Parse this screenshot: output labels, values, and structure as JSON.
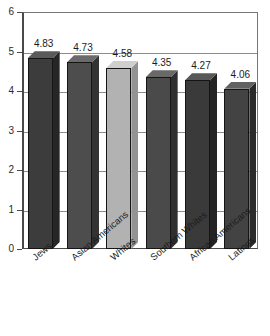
{
  "chart_data": {
    "type": "bar",
    "title": "",
    "subtitle": "",
    "xlabel": "",
    "ylabel": "",
    "categories": [
      "Jews",
      "Asian Americans",
      "Whites",
      "Southern Whites",
      "African Americans",
      "Latinos"
    ],
    "values": [
      4.83,
      4.73,
      4.58,
      4.35,
      4.27,
      4.06
    ],
    "value_labels": [
      "4.83",
      "4.73",
      "4.58",
      "4.35",
      "4.27",
      "4.06"
    ],
    "ylim": [
      0,
      6
    ],
    "yticks": [
      0,
      1,
      2,
      3,
      4,
      5,
      6
    ],
    "ytick_labels": [
      "0",
      "1",
      "2",
      "3",
      "4",
      "5",
      "6"
    ],
    "grid": true,
    "grid_axis": "y",
    "legend": false,
    "legend_position": "none",
    "style": "3d-column",
    "bar_colors": [
      "#3c3c3c",
      "#4d4d4d",
      "#b2b2b2",
      "#4a4a4a",
      "#3a3a3a",
      "#434343"
    ],
    "bar_top_colors": [
      "#5a5a5a",
      "#6b6b6b",
      "#cfcfcf",
      "#696969",
      "#585858",
      "#616161"
    ],
    "bar_side_colors": [
      "#262626",
      "#333333",
      "#939393",
      "#2f2f2f",
      "#242424",
      "#2b2b2b"
    ],
    "axis_color": "#4a4a4a",
    "grid_color": "#8d8d8d",
    "background": "#ffffff"
  },
  "footer": {
    "cut_off_text": ""
  }
}
